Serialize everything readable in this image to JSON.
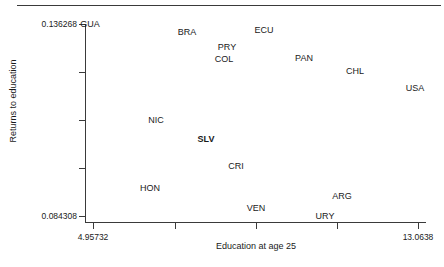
{
  "chart_data": {
    "type": "scatter",
    "title": "",
    "xlabel": "Education at age 25",
    "ylabel": "Returns to education",
    "xlim": [
      4.95732,
      13.0638
    ],
    "ylim": [
      0.084308,
      0.136268
    ],
    "grid": false,
    "legend": "none",
    "marker_style": "text-labels-only",
    "highlight_point": "SLV",
    "x_tick_labels": [
      "4.95732",
      "13.0638"
    ],
    "y_tick_labels": [
      "0.136268",
      "0.084308"
    ],
    "x_ticks": [
      4.95732,
      6.98,
      9.0,
      11.05,
      13.0638
    ],
    "y_ticks": [
      0.136268,
      0.123278,
      0.110288,
      0.097298,
      0.084308
    ],
    "points": [
      {
        "label": "GUA",
        "x": 5.18,
        "y": 0.13627,
        "px": 90,
        "py": 24,
        "bold": false
      },
      {
        "label": "BRA",
        "x": 7.23,
        "y": 0.13417,
        "px": 187,
        "py": 32,
        "bold": false
      },
      {
        "label": "ECU",
        "x": 9.05,
        "y": 0.13469,
        "px": 264,
        "py": 30,
        "bold": false
      },
      {
        "label": "PRY",
        "x": 8.18,
        "y": 0.13023,
        "px": 227,
        "py": 47,
        "bold": false
      },
      {
        "label": "COL",
        "x": 8.12,
        "y": 0.12708,
        "px": 224,
        "py": 59,
        "bold": false
      },
      {
        "label": "PAN",
        "x": 10.0,
        "y": 0.12734,
        "px": 304,
        "py": 58,
        "bold": false
      },
      {
        "label": "CHL",
        "x": 11.22,
        "y": 0.12393,
        "px": 355,
        "py": 71,
        "bold": false
      },
      {
        "label": "USA",
        "x": 12.65,
        "y": 0.11947,
        "px": 415,
        "py": 88,
        "bold": false
      },
      {
        "label": "NIC",
        "x": 6.49,
        "y": 0.11108,
        "px": 156,
        "py": 120,
        "bold": false
      },
      {
        "label": "SLV",
        "x": 7.67,
        "y": 0.1061,
        "px": 206,
        "py": 139,
        "bold": true
      },
      {
        "label": "CRI",
        "x": 8.38,
        "y": 0.09902,
        "px": 236,
        "py": 166,
        "bold": false
      },
      {
        "label": "HON",
        "x": 6.35,
        "y": 0.09325,
        "px": 150,
        "py": 188,
        "bold": false
      },
      {
        "label": "ARG",
        "x": 10.89,
        "y": 0.09115,
        "px": 342,
        "py": 196,
        "bold": false
      },
      {
        "label": "VEN",
        "x": 8.82,
        "y": 0.088,
        "px": 256,
        "py": 208,
        "bold": false
      },
      {
        "label": "URY",
        "x": 10.42,
        "y": 0.0859,
        "px": 325,
        "py": 216,
        "bold": false
      }
    ]
  },
  "axes": {
    "y_title": "Returns to education",
    "x_title": "Education at age 25",
    "y_labels": [
      {
        "text": "0.136268",
        "py": 24
      },
      {
        "text": "0.084308",
        "py": 216
      }
    ],
    "x_labels": [
      {
        "text": "4.95732",
        "px": 93
      },
      {
        "text": "13.0638",
        "px": 418
      }
    ],
    "y_tick_positions": [
      24,
      72,
      120,
      168,
      216
    ],
    "x_tick_positions": [
      93,
      175,
      256,
      337,
      418
    ]
  },
  "colors": {
    "axis": "#3a3a3a",
    "text": "#1a1a1a",
    "background": "#ffffff"
  }
}
